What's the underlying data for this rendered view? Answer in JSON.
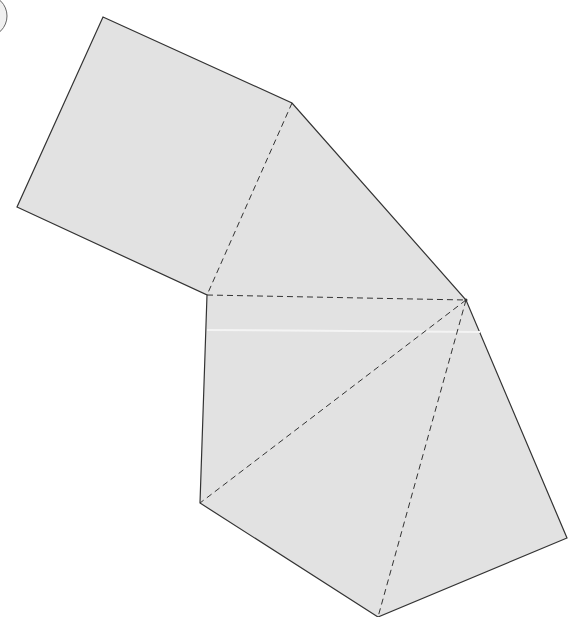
{
  "diagram": {
    "type": "net",
    "fill_color": "#e2e2e2",
    "edge_color": "#333333",
    "faces": [
      {
        "name": "square",
        "points": "103,17 292,103 207,295 17,207"
      },
      {
        "name": "triangle-top",
        "points": "292,103 466,300 207,295"
      },
      {
        "name": "triangle-left",
        "points": "207,295 466,300 200,503"
      },
      {
        "name": "triangle-mid",
        "points": "200,503 466,300 378,617"
      },
      {
        "name": "triangle-right",
        "points": "466,300 567,538 378,617"
      }
    ],
    "outline": "103,17 292,103 466,300 567,538 378,617 200,503 207,295 17,207",
    "fold_lines": [
      {
        "x1": 292,
        "y1": 103,
        "x2": 207,
        "y2": 295
      },
      {
        "x1": 207,
        "y1": 295,
        "x2": 466,
        "y2": 300
      },
      {
        "x1": 466,
        "y1": 300,
        "x2": 200,
        "y2": 503
      },
      {
        "x1": 466,
        "y1": 300,
        "x2": 378,
        "y2": 617
      }
    ],
    "partial_circle": {
      "cx": -14,
      "cy": 16,
      "r": 21
    }
  }
}
